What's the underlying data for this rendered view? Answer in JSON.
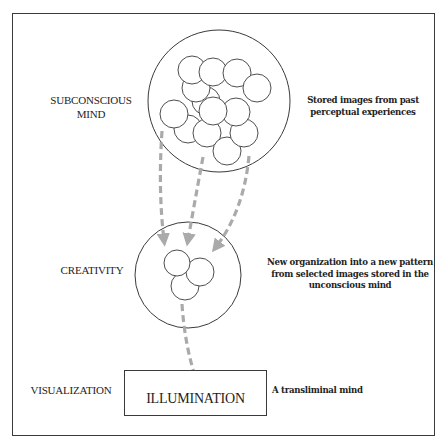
{
  "diagram": {
    "levels": [
      {
        "id": "subconscious",
        "left_label_line1": "SUBCONSCIOUS",
        "left_label_line2": "MIND",
        "right_text_line1": "Stored images from past",
        "right_text_line2": "perceptual experiences"
      },
      {
        "id": "creativity",
        "left_label": "CREATIVITY",
        "right_text_line1": "New organization into a new pattern",
        "right_text_line2": "from selected images stored in the",
        "right_text_line3": "unconscious mind"
      },
      {
        "id": "visualization",
        "left_label": "VISUALIZATION",
        "box_label": "ILLUMINATION",
        "right_text": "A transliminal mind"
      }
    ],
    "colors": {
      "line": "#3a3a3a",
      "arrow": "#aaaaaa",
      "background": "#ffffff"
    }
  }
}
